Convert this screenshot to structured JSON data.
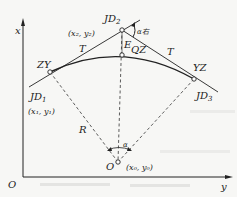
{
  "diagram": {
    "axes": {
      "vertical_label": "x",
      "horizontal_label": "y",
      "origin_label": "O"
    },
    "points": {
      "jd1": {
        "name": "JD",
        "sub": "1",
        "coord": "(x₁, y₁)"
      },
      "jd2": {
        "name": "JD",
        "sub": "2",
        "coord": "(x₂, y₂)"
      },
      "jd3": {
        "name": "JD",
        "sub": "3"
      },
      "zy": "ZY",
      "qz": "QZ",
      "yz": "YZ",
      "center": {
        "name": "O",
        "coord": "(x₀, y₀)"
      }
    },
    "labels": {
      "tangent_left": "T",
      "tangent_right": "T",
      "external_distance": "E",
      "radius": "R",
      "central_angle": "α",
      "deflection_angle": "α右"
    }
  }
}
